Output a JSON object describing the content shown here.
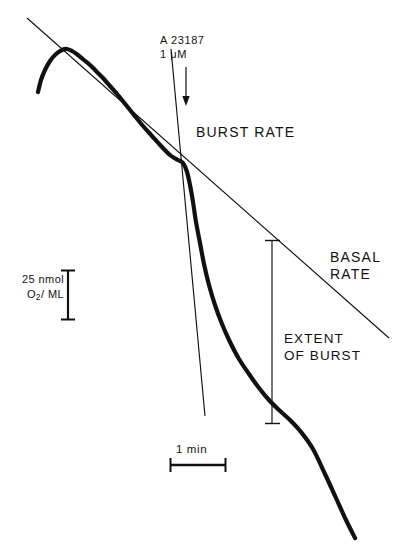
{
  "figure": {
    "type": "oxygen-electrode-trace",
    "background": "#ffffff",
    "ink": "#111111",
    "labels": {
      "agent_name": "A 23187",
      "agent_conc": "1 μM",
      "burst_rate": "BURST RATE",
      "basal_rate_line1": "BASAL",
      "basal_rate_line2": "RATE",
      "extent_line1": "EXTENT",
      "extent_line2": "OF BURST",
      "y_scale_line1": "25 nmol",
      "y_scale_line2_pre": "O",
      "y_scale_line2_sub": "2",
      "y_scale_line2_post": "/ ML",
      "x_scale": "1 min"
    }
  },
  "chart_data": {
    "type": "line",
    "title": "",
    "subtitle": "",
    "xlabel": "Time",
    "ylabel": "O2 concentration (nmol O2 / mL)",
    "grid": false,
    "legend": "none",
    "axes_drawn": false,
    "scale_bars": {
      "y": {
        "label": "25 nmol O2/ML",
        "value": 25,
        "units": "nmol O2/mL",
        "x_px": 68,
        "y_top_px": 270,
        "y_bottom_px": 320,
        "length_px": 50
      },
      "x": {
        "label": "1 min",
        "value": 1,
        "units": "min",
        "y_px": 465,
        "x_left_px": 170,
        "x_right_px": 226,
        "length_px": 56
      }
    },
    "annotations": [
      {
        "name": "addition-arrow",
        "label": "A 23187 1 μM",
        "arrow_from": [
          186,
          67
        ],
        "arrow_to": [
          186,
          104
        ],
        "meaning": "calcium ionophore added at this time"
      },
      {
        "name": "basal-rate-tangent",
        "label": "BASAL RATE",
        "from": [
          27,
          18
        ],
        "to": [
          389,
          338
        ],
        "meaning": "extrapolated pre-stimulus respiration rate"
      },
      {
        "name": "burst-rate-tangent",
        "label": "BURST RATE",
        "from": [
          171,
          49
        ],
        "to": [
          205,
          416
        ],
        "meaning": "steep tangent through the burst phase"
      },
      {
        "name": "extent-of-burst-arrow",
        "label": "EXTENT OF BURST",
        "from": [
          272,
          240
        ],
        "to": [
          272,
          424
        ],
        "meaning": "vertical distance between basal line and trace"
      }
    ],
    "series": [
      {
        "name": "O2 trace",
        "stroke": "#111111",
        "points_px": [
          [
            38,
            92
          ],
          [
            41,
            80
          ],
          [
            45,
            70
          ],
          [
            50,
            61
          ],
          [
            56,
            54
          ],
          [
            62,
            50
          ],
          [
            67,
            49
          ],
          [
            72,
            51
          ],
          [
            78,
            55
          ],
          [
            84,
            60
          ],
          [
            90,
            65
          ],
          [
            96,
            71
          ],
          [
            103,
            78
          ],
          [
            110,
            86
          ],
          [
            118,
            95
          ],
          [
            126,
            105
          ],
          [
            134,
            115
          ],
          [
            143,
            126
          ],
          [
            152,
            136
          ],
          [
            161,
            146
          ],
          [
            170,
            155
          ],
          [
            178,
            160
          ],
          [
            183,
            163
          ],
          [
            187,
            172
          ],
          [
            190,
            185
          ],
          [
            193,
            202
          ],
          [
            196,
            222
          ],
          [
            200,
            243
          ],
          [
            204,
            264
          ],
          [
            209,
            285
          ],
          [
            215,
            305
          ],
          [
            222,
            324
          ],
          [
            230,
            342
          ],
          [
            239,
            359
          ],
          [
            249,
            374
          ],
          [
            259,
            388
          ],
          [
            269,
            400
          ],
          [
            279,
            410
          ],
          [
            290,
            420
          ],
          [
            301,
            432
          ],
          [
            313,
            449
          ],
          [
            325,
            474
          ],
          [
            336,
            498
          ],
          [
            346,
            520
          ],
          [
            355,
            538
          ]
        ],
        "description": "Baseline respiration with an initial upward hook, a linear basal decline, a sharp burst (steep drop) triggered by the ionophore, then relaxation back to a new steady slope."
      }
    ],
    "phases": [
      {
        "name": "equilibration-hook",
        "start_px": [
          38,
          92
        ],
        "end_px": [
          67,
          49
        ]
      },
      {
        "name": "basal-respiration",
        "start_px": [
          67,
          49
        ],
        "end_px": [
          183,
          163
        ]
      },
      {
        "name": "respiratory-burst",
        "start_px": [
          183,
          163
        ],
        "end_px": [
          272,
          403
        ]
      },
      {
        "name": "post-burst-rate",
        "start_px": [
          272,
          403
        ],
        "end_px": [
          355,
          538
        ]
      }
    ]
  }
}
